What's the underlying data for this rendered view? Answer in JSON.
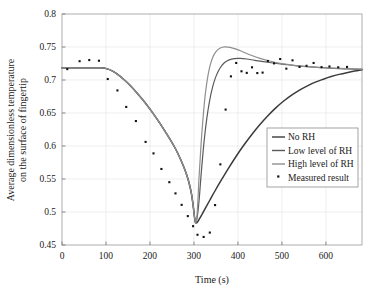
{
  "chart_data": {
    "type": "line",
    "title": "",
    "xlabel": "Time (s)",
    "ylabel_line1": "Average dimensionless temperature",
    "ylabel_line2": "on the surface of fingertip",
    "xlim": [
      0,
      682
    ],
    "ylim": [
      0.45,
      0.8
    ],
    "xticks": [
      0,
      100,
      200,
      300,
      400,
      500,
      600
    ],
    "xtick_labels": [
      "0",
      "100",
      "200",
      "300",
      "400",
      "500",
      "600"
    ],
    "yticks": [
      0.45,
      0.5,
      0.55,
      0.6,
      0.65,
      0.7,
      0.75,
      0.8
    ],
    "ytick_labels": [
      "0.45",
      "0.5",
      "0.55",
      "0.6",
      "0.65",
      "0.7",
      "0.75",
      "0.8"
    ],
    "grid": true,
    "legend_position": "lower right",
    "series": [
      {
        "name": "No RH",
        "color": "#3b3b3b",
        "width": 1.5,
        "marker": "none",
        "points": [
          [
            0,
            0.7185
          ],
          [
            20,
            0.7185
          ],
          [
            40,
            0.7185
          ],
          [
            60,
            0.7185
          ],
          [
            80,
            0.7185
          ],
          [
            95,
            0.7182
          ],
          [
            105,
            0.7165
          ],
          [
            115,
            0.7135
          ],
          [
            125,
            0.7092
          ],
          [
            140,
            0.7012
          ],
          [
            155,
            0.6918
          ],
          [
            170,
            0.6808
          ],
          [
            185,
            0.6688
          ],
          [
            200,
            0.6558
          ],
          [
            215,
            0.6418
          ],
          [
            230,
            0.6268
          ],
          [
            245,
            0.6108
          ],
          [
            258,
            0.5958
          ],
          [
            270,
            0.5792
          ],
          [
            280,
            0.5628
          ],
          [
            288,
            0.5462
          ],
          [
            294,
            0.5288
          ],
          [
            298,
            0.5105
          ],
          [
            301,
            0.4935
          ],
          [
            303,
            0.4848
          ],
          [
            305,
            0.4832
          ],
          [
            308,
            0.4848
          ],
          [
            312,
            0.4892
          ],
          [
            318,
            0.4962
          ],
          [
            326,
            0.5058
          ],
          [
            336,
            0.5178
          ],
          [
            348,
            0.5322
          ],
          [
            362,
            0.5482
          ],
          [
            378,
            0.5658
          ],
          [
            396,
            0.5845
          ],
          [
            414,
            0.6018
          ],
          [
            432,
            0.6178
          ],
          [
            450,
            0.6325
          ],
          [
            468,
            0.6458
          ],
          [
            486,
            0.6578
          ],
          [
            504,
            0.6682
          ],
          [
            522,
            0.6772
          ],
          [
            540,
            0.6848
          ],
          [
            558,
            0.6912
          ],
          [
            576,
            0.6968
          ],
          [
            594,
            0.7012
          ],
          [
            612,
            0.7052
          ],
          [
            630,
            0.7085
          ],
          [
            650,
            0.7115
          ],
          [
            665,
            0.7135
          ],
          [
            682,
            0.7155
          ]
        ]
      },
      {
        "name": "Low level of RH",
        "color": "#5a5a5a",
        "width": 1.2,
        "marker": "none",
        "points": [
          [
            0,
            0.7185
          ],
          [
            40,
            0.7185
          ],
          [
            80,
            0.7185
          ],
          [
            95,
            0.7182
          ],
          [
            110,
            0.7152
          ],
          [
            125,
            0.7092
          ],
          [
            140,
            0.7012
          ],
          [
            155,
            0.6918
          ],
          [
            170,
            0.6808
          ],
          [
            185,
            0.6688
          ],
          [
            200,
            0.6558
          ],
          [
            215,
            0.6418
          ],
          [
            230,
            0.6268
          ],
          [
            245,
            0.6108
          ],
          [
            258,
            0.5958
          ],
          [
            270,
            0.5792
          ],
          [
            280,
            0.5628
          ],
          [
            288,
            0.5462
          ],
          [
            294,
            0.5288
          ],
          [
            298,
            0.5105
          ],
          [
            301,
            0.4935
          ],
          [
            303,
            0.4852
          ],
          [
            305,
            0.4848
          ],
          [
            307,
            0.4905
          ],
          [
            310,
            0.5062
          ],
          [
            313,
            0.5285
          ],
          [
            316,
            0.5548
          ],
          [
            320,
            0.5858
          ],
          [
            324,
            0.6132
          ],
          [
            329,
            0.6408
          ],
          [
            335,
            0.6665
          ],
          [
            342,
            0.6885
          ],
          [
            350,
            0.7055
          ],
          [
            359,
            0.7178
          ],
          [
            369,
            0.7262
          ],
          [
            380,
            0.7305
          ],
          [
            392,
            0.7325
          ],
          [
            405,
            0.7328
          ],
          [
            420,
            0.7318
          ],
          [
            438,
            0.7298
          ],
          [
            458,
            0.7278
          ],
          [
            480,
            0.7258
          ],
          [
            505,
            0.7238
          ],
          [
            530,
            0.7218
          ],
          [
            558,
            0.7202
          ],
          [
            588,
            0.7188
          ],
          [
            620,
            0.7175
          ],
          [
            650,
            0.7168
          ],
          [
            682,
            0.7162
          ]
        ]
      },
      {
        "name": "High level of RH",
        "color": "#8e8e8e",
        "width": 1.2,
        "marker": "none",
        "points": [
          [
            0,
            0.7185
          ],
          [
            40,
            0.7185
          ],
          [
            80,
            0.7185
          ],
          [
            95,
            0.7182
          ],
          [
            110,
            0.7152
          ],
          [
            125,
            0.7092
          ],
          [
            140,
            0.7012
          ],
          [
            155,
            0.6918
          ],
          [
            170,
            0.6808
          ],
          [
            185,
            0.6688
          ],
          [
            200,
            0.6558
          ],
          [
            215,
            0.6418
          ],
          [
            230,
            0.6268
          ],
          [
            245,
            0.6108
          ],
          [
            258,
            0.5958
          ],
          [
            270,
            0.5792
          ],
          [
            280,
            0.5628
          ],
          [
            288,
            0.5462
          ],
          [
            294,
            0.5288
          ],
          [
            298,
            0.5105
          ],
          [
            301,
            0.4935
          ],
          [
            303,
            0.4852
          ],
          [
            305,
            0.4852
          ],
          [
            307,
            0.4962
          ],
          [
            309,
            0.5182
          ],
          [
            311,
            0.5462
          ],
          [
            314,
            0.5792
          ],
          [
            317,
            0.6112
          ],
          [
            321,
            0.6452
          ],
          [
            325,
            0.6738
          ],
          [
            330,
            0.6995
          ],
          [
            336,
            0.7202
          ],
          [
            343,
            0.7348
          ],
          [
            351,
            0.7438
          ],
          [
            360,
            0.7485
          ],
          [
            370,
            0.7502
          ],
          [
            382,
            0.7495
          ],
          [
            396,
            0.7468
          ],
          [
            412,
            0.7425
          ],
          [
            430,
            0.7375
          ],
          [
            450,
            0.7328
          ],
          [
            472,
            0.7288
          ],
          [
            496,
            0.7252
          ],
          [
            522,
            0.7228
          ],
          [
            550,
            0.7205
          ],
          [
            580,
            0.7192
          ],
          [
            615,
            0.718
          ],
          [
            650,
            0.7172
          ],
          [
            682,
            0.7165
          ]
        ]
      }
    ],
    "measured_result": {
      "name": "Measured result",
      "marker": "square",
      "color": "#111111",
      "size": 2.1,
      "points": [
        [
          12,
          0.7165
        ],
        [
          40,
          0.7285
        ],
        [
          62,
          0.7302
        ],
        [
          84,
          0.7292
        ],
        [
          104,
          0.7015
        ],
        [
          126,
          0.6842
        ],
        [
          146,
          0.6592
        ],
        [
          168,
          0.6378
        ],
        [
          190,
          0.6062
        ],
        [
          208,
          0.5888
        ],
        [
          226,
          0.5652
        ],
        [
          244,
          0.5452
        ],
        [
          258,
          0.5282
        ],
        [
          272,
          0.5108
        ],
        [
          286,
          0.4938
        ],
        [
          298,
          0.4785
        ],
        [
          308,
          0.4655
        ],
        [
          322,
          0.4622
        ],
        [
          336,
          0.4688
        ],
        [
          348,
          0.5105
        ],
        [
          360,
          0.5722
        ],
        [
          372,
          0.6552
        ],
        [
          384,
          0.7055
        ],
        [
          396,
          0.7258
        ],
        [
          408,
          0.7132
        ],
        [
          420,
          0.7108
        ],
        [
          432,
          0.7192
        ],
        [
          444,
          0.7105
        ],
        [
          456,
          0.7112
        ],
        [
          468,
          0.7288
        ],
        [
          482,
          0.7252
        ],
        [
          496,
          0.7318
        ],
        [
          510,
          0.7172
        ],
        [
          524,
          0.7298
        ],
        [
          540,
          0.7198
        ],
        [
          556,
          0.7215
        ],
        [
          572,
          0.7258
        ],
        [
          590,
          0.7195
        ],
        [
          608,
          0.7205
        ],
        [
          628,
          0.7192
        ],
        [
          648,
          0.7198
        ]
      ]
    },
    "legend_entries": [
      {
        "label": "No RH",
        "type": "line",
        "color": "#3b3b3b"
      },
      {
        "label": "Low level of RH",
        "type": "line",
        "color": "#5a5a5a"
      },
      {
        "label": "High level of RH",
        "type": "line",
        "color": "#8e8e8e"
      },
      {
        "label": "Measured result",
        "type": "marker",
        "color": "#111111"
      }
    ]
  }
}
